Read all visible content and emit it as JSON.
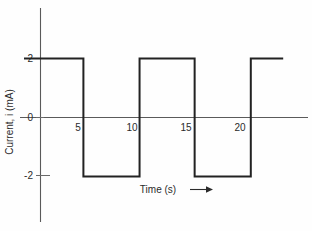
{
  "figure": {
    "name": "current-time-square-wave",
    "background_color": "#fefefe",
    "line_color": "#222222",
    "axis_color": "#5a5a5a",
    "text_color": "#2b2b2b"
  },
  "chart_data": {
    "type": "line",
    "title": "",
    "subtitle": "",
    "xlabel": "Time (s)",
    "xlabel_arrow": "⟶",
    "ylabel": "Current, i (mA)",
    "xlim": [
      0,
      24.5
    ],
    "ylim": [
      -3.2,
      3.4
    ],
    "grid": false,
    "legend": null,
    "x_ticks": [
      5,
      10,
      15,
      20
    ],
    "x_tick_labels": [
      "5",
      "10",
      "15",
      "20"
    ],
    "y_ticks": [
      2,
      0,
      -2
    ],
    "y_tick_labels": [
      "2",
      "0",
      "-2"
    ],
    "waveform": {
      "description": "Periodic square wave alternating between +2 mA and -2 mA",
      "amplitude_high": 2,
      "amplitude_low": -2,
      "units": "mA",
      "period": 10,
      "points": [
        {
          "t": 0,
          "i": 2
        },
        {
          "t": 5.5,
          "i": 2
        },
        {
          "t": 5.5,
          "i": -2
        },
        {
          "t": 10.7,
          "i": -2
        },
        {
          "t": 10.7,
          "i": 2
        },
        {
          "t": 15.8,
          "i": 2
        },
        {
          "t": 15.8,
          "i": -2
        },
        {
          "t": 21.0,
          "i": -2
        },
        {
          "t": 21.0,
          "i": 2
        },
        {
          "t": 24.0,
          "i": 2
        }
      ]
    },
    "series": [
      {
        "name": "Current i",
        "x": [
          0,
          5.5,
          5.5,
          10.7,
          10.7,
          15.8,
          15.8,
          21.0,
          21.0,
          24.0
        ],
        "values": [
          2,
          2,
          -2,
          -2,
          2,
          2,
          -2,
          -2,
          2,
          2
        ]
      }
    ]
  }
}
